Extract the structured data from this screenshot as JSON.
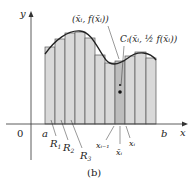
{
  "figure": {
    "caption": "(b)",
    "axes": {
      "x_label": "x",
      "y_label": "y",
      "origin_label": "0"
    },
    "interval": {
      "left": "a",
      "right": "b"
    },
    "rectangle_labels": [
      "R",
      "R",
      "R"
    ],
    "rectangle_label_subscripts": [
      "1",
      "2",
      "3"
    ],
    "point_label_top": "(x̄ᵢ, f(x̄ᵢ))",
    "centroid_label": "Cᵢ(x̄ᵢ, ½ f(x̄ᵢ))",
    "tick_labels": {
      "left": "xᵢ₋₁",
      "mid": "x̄ᵢ",
      "right": "xᵢ"
    },
    "rectangle_count": 11,
    "colors": {
      "fill": "#d9d9d9",
      "highlight": "#b9b9b9",
      "stroke": "#444444",
      "curve": "#222222"
    }
  }
}
